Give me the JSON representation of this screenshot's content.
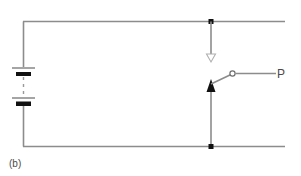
{
  "figure": {
    "caption": "(b)",
    "terminal_label": "P",
    "type": "electrical-circuit-schematic",
    "background_color": "#ffffff",
    "wire_color": "#8c8c8c",
    "node_color": "#111111",
    "label_color": "#4a4a4a"
  },
  "components": {
    "battery": {
      "name": "battery",
      "cell_count": 2,
      "has_dashed_continuation": true,
      "plate_long_color": "#7e7e7e",
      "plate_short_color": "#111111"
    },
    "top_node": {
      "name": "top-junction-node"
    },
    "bottom_node": {
      "name": "bottom-junction-node"
    },
    "down_arrow": {
      "name": "down-arrow-indicator",
      "style": "hollow",
      "direction": "down",
      "color": "#b0b0b0"
    },
    "up_arrow": {
      "name": "switch-contact-arrow",
      "style": "filled",
      "direction": "up",
      "color": "#111111"
    },
    "switch": {
      "name": "open-switch",
      "state": "open",
      "contact_ring_color": "#6f6f6f"
    }
  }
}
